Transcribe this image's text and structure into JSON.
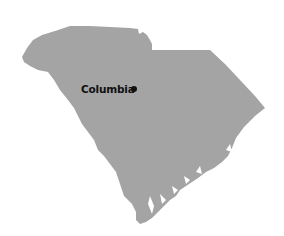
{
  "map": {
    "region": "South Carolina",
    "fill_color": "#a4a4a4",
    "background_color": "#ffffff",
    "cities": [
      {
        "name": "Columbia",
        "marker": "dot",
        "label_color": "#111111"
      }
    ]
  }
}
